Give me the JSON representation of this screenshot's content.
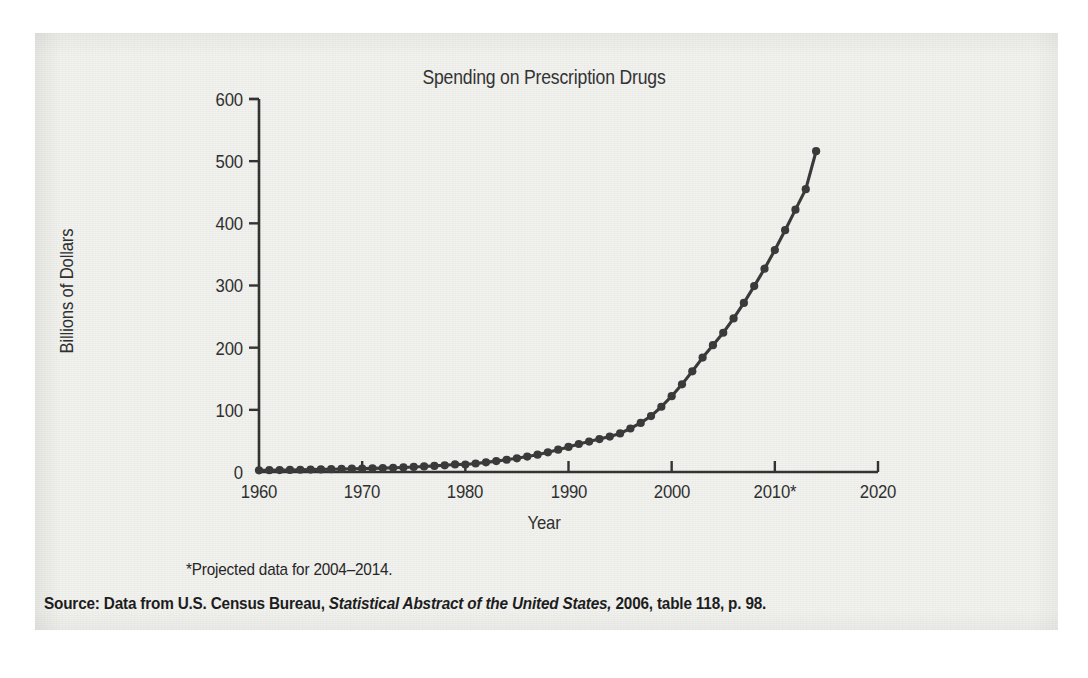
{
  "figure": {
    "background_color": "#f2f2ef",
    "ink_color": "#3a3a3a"
  },
  "chart_data": {
    "type": "line",
    "title": "Spending on Prescription Drugs",
    "xlabel": "Year",
    "ylabel": "Billions of Dollars",
    "xlim": [
      1960,
      2020
    ],
    "ylim": [
      0,
      600
    ],
    "grid": false,
    "legend": null,
    "marker": "filled-circle",
    "line_color": "#3a3a3a",
    "xticks": [
      "1960",
      "1970",
      "1980",
      "1990",
      "2000",
      "2010*",
      "2020"
    ],
    "xtick_values": [
      1960,
      1970,
      1980,
      1990,
      2000,
      2010,
      2020
    ],
    "yticks": [
      "0",
      "100",
      "200",
      "300",
      "400",
      "500",
      "600"
    ],
    "ytick_values": [
      0,
      100,
      200,
      300,
      400,
      500,
      600
    ],
    "x": [
      1960,
      1961,
      1962,
      1963,
      1964,
      1965,
      1966,
      1967,
      1968,
      1969,
      1970,
      1971,
      1972,
      1973,
      1974,
      1975,
      1976,
      1977,
      1978,
      1979,
      1980,
      1981,
      1982,
      1983,
      1984,
      1985,
      1986,
      1987,
      1988,
      1989,
      1990,
      1991,
      1992,
      1993,
      1994,
      1995,
      1996,
      1997,
      1998,
      1999,
      2000,
      2001,
      2002,
      2003,
      2004,
      2005,
      2006,
      2007,
      2008,
      2009,
      2010,
      2011,
      2012,
      2013,
      2014
    ],
    "values": [
      2.7,
      2.9,
      3.1,
      3.3,
      3.6,
      3.9,
      4.2,
      4.5,
      4.9,
      5.3,
      5.5,
      5.9,
      6.3,
      6.8,
      7.3,
      8.1,
      8.9,
      9.8,
      10.8,
      12.2,
      12.0,
      13.7,
      15.5,
      17.5,
      19.7,
      22.0,
      24.8,
      27.9,
      31.6,
      35.9,
      40.3,
      45.0,
      49.0,
      53.0,
      57.0,
      62.0,
      70.0,
      79.0,
      90.0,
      105.0,
      122.0,
      141.0,
      162.0,
      184.0,
      204.0,
      224.0,
      247.0,
      272.0,
      299.0,
      327.0,
      357.0,
      389.0,
      422.0,
      455.0,
      516.0
    ],
    "annotations": [
      "*Projected data for 2004–2014."
    ]
  },
  "footnotes": {
    "projected": "*Projected data for 2004–2014.",
    "source_label": "Source: Data from U.S. Census Bureau, ",
    "source_italic": "Statistical Abstract of the United States,",
    "source_rest": " 2006, table 118, p. 98."
  }
}
